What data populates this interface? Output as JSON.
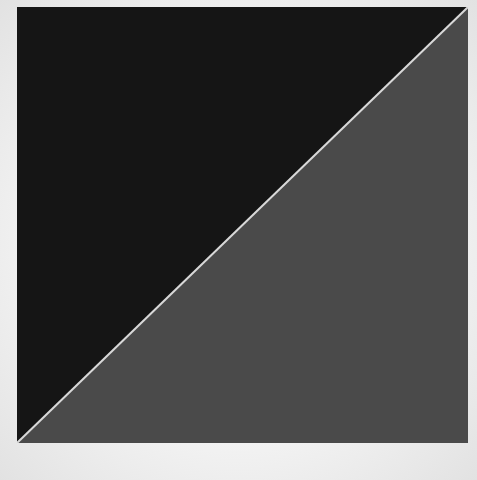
{
  "artwork": {
    "description": "Square divided diagonally into black upper-left triangle and gray lower-right triangle on white paper",
    "colors": {
      "paper": "#efefef",
      "black_field": "#151515",
      "gray_field": "#4a4a4a",
      "diagonal_line": "#d8d8d8"
    }
  }
}
